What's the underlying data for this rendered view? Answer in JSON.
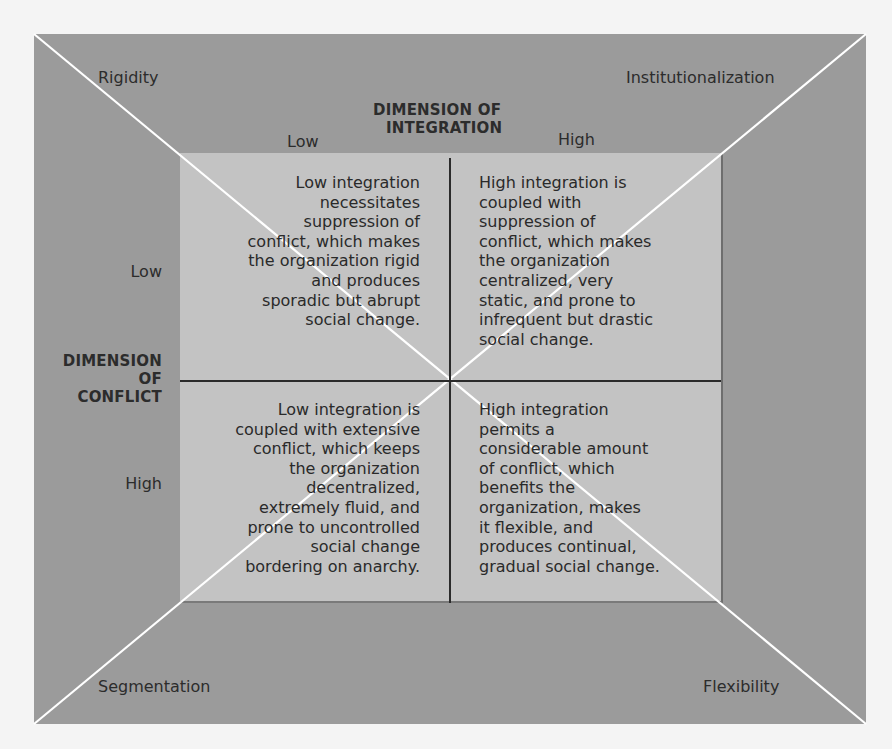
{
  "diagram": {
    "corners": {
      "top_left": "Rigidity",
      "top_right": "Institutionalization",
      "bottom_left": "Segmentation",
      "bottom_right": "Flexibility"
    },
    "x_axis": {
      "title_line1": "DIMENSION OF",
      "title_line2": "INTEGRATION",
      "low_label": "Low",
      "high_label": "High"
    },
    "y_axis": {
      "title_line1": "DIMENSION",
      "title_line2": "OF",
      "title_line3": "CONFLICT",
      "low_label": "Low",
      "high_label": "High"
    },
    "quadrants": {
      "low_integration_low_conflict": {
        "lines": [
          "Low integration",
          "necessitates",
          "suppression of",
          "conflict, which makes",
          "the organization rigid",
          "and produces",
          "sporadic but abrupt",
          "social change."
        ]
      },
      "high_integration_low_conflict": {
        "lines": [
          "High integration is",
          "coupled with",
          "suppression of",
          "conflict, which makes",
          "the organization",
          "centralized, very",
          "static, and prone to",
          "infrequent but drastic",
          "social change."
        ]
      },
      "low_integration_high_conflict": {
        "lines": [
          "Low integration is",
          "coupled with extensive",
          "conflict, which keeps",
          "the organization",
          "decentralized,",
          "extremely fluid, and",
          "prone to uncontrolled",
          "social change",
          "bordering on anarchy."
        ]
      },
      "high_integration_high_conflict": {
        "lines": [
          "High integration",
          "permits a",
          "considerable amount",
          "of conflict, which",
          "benefits the",
          "organization, makes",
          "it flexible, and",
          "produces continual,",
          "gradual social change."
        ]
      }
    },
    "colors": {
      "outer_fill": "#9b9b9b",
      "inner_fill": "#c3c3c3",
      "diagonal_lines": "#ffffff",
      "divider_lines": "#2a2a2a",
      "text": "#2a2a2a"
    }
  }
}
